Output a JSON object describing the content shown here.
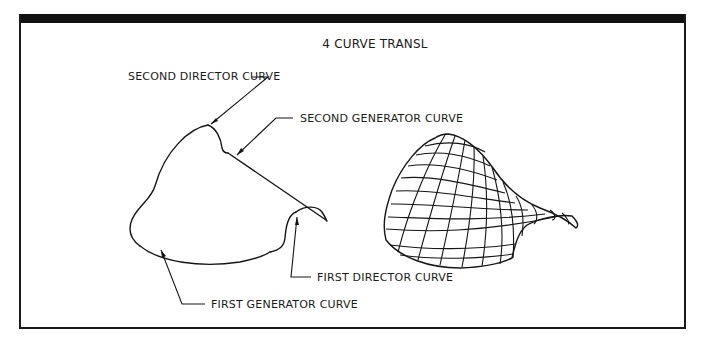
{
  "figure": {
    "title": "4 CURVE TRANSL",
    "labels": {
      "second_director": "SECOND DIRECTOR CURVE",
      "second_generator": "SECOND GENERATOR CURVE",
      "first_director": "FIRST DIRECTOR CURVE",
      "first_generator": "FIRST GENERATOR CURVE"
    },
    "colors": {
      "line": "#151515",
      "background": "#ffffff",
      "frame_bar": "#111111"
    }
  }
}
